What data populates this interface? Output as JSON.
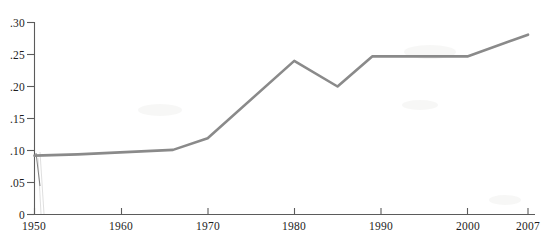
{
  "chart_data": {
    "type": "line",
    "title": "",
    "xlabel": "",
    "ylabel": "",
    "xlim": [
      1950,
      2007
    ],
    "ylim": [
      0,
      0.3
    ],
    "grid": false,
    "legend": null,
    "x_ticks": [
      1950,
      1960,
      1970,
      1980,
      1990,
      2000,
      2007
    ],
    "x_tick_labels": [
      "1950",
      "1960",
      "1970",
      "1980",
      "1990",
      "2000",
      "2007"
    ],
    "y_ticks": [
      0,
      0.05,
      0.1,
      0.15,
      0.2,
      0.25,
      0.3
    ],
    "y_tick_labels": [
      "0",
      ".05",
      ".10",
      ".15",
      ".20",
      ".25",
      ".30"
    ],
    "line_color": "#8a8a8a",
    "series": [
      {
        "name": "series-1",
        "x": [
          1950,
          1955,
          1966,
          1970,
          1980,
          1985,
          1989,
          2000,
          2007
        ],
        "values": [
          0.092,
          0.094,
          0.101,
          0.119,
          0.24,
          0.2,
          0.247,
          0.247,
          0.281
        ]
      }
    ]
  },
  "axis": {
    "y_labels": [
      ".30",
      ".25",
      ".20",
      ".15",
      ".10",
      ".05",
      "0"
    ],
    "x_labels": [
      "1950",
      "1960",
      "1970",
      "1980",
      "1990",
      "2000",
      "2007"
    ]
  }
}
